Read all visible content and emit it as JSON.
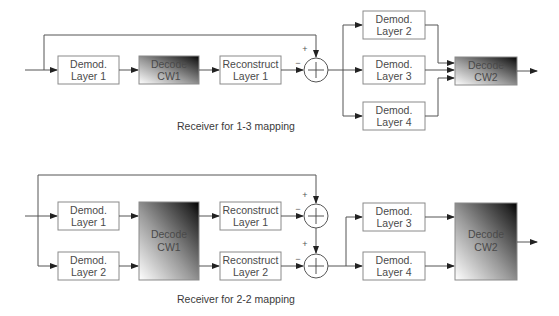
{
  "diagrams": [
    {
      "caption": "Receiver for 1-3 mapping",
      "blocks": {
        "demod1": [
          "Demod.",
          "Layer 1"
        ],
        "decode_cw1": [
          "Decode",
          "CW1"
        ],
        "reconstruct1": [
          "Reconstruct",
          "Layer 1"
        ],
        "demod2": [
          "Demod.",
          "Layer 2"
        ],
        "demod3": [
          "Demod.",
          "Layer 3"
        ],
        "demod4": [
          "Demod.",
          "Layer 4"
        ],
        "decode_cw2": [
          "Decode",
          "CW2"
        ]
      },
      "summer": {
        "plus": "+",
        "minus": "−"
      }
    },
    {
      "caption": "Receiver for 2-2 mapping",
      "blocks": {
        "demod1": [
          "Demod.",
          "Layer 1"
        ],
        "demod2": [
          "Demod.",
          "Layer 2"
        ],
        "decode_cw1": [
          "Decode",
          "CW1"
        ],
        "reconstruct1": [
          "Reconstruct",
          "Layer 1"
        ],
        "reconstruct2": [
          "Reconstruct",
          "Layer 2"
        ],
        "demod3": [
          "Demod.",
          "Layer 3"
        ],
        "demod4": [
          "Demod.",
          "Layer 4"
        ],
        "decode_cw2": [
          "Decode",
          "CW2"
        ]
      },
      "summers": [
        {
          "plus": "+",
          "minus": "−"
        },
        {
          "plus": "+",
          "minus": "−"
        }
      ]
    }
  ],
  "colors": {
    "box_border": "#8a8a8a",
    "line": "#555555",
    "text": "#4a4a4a",
    "gradient_dark": "#000000",
    "gradient_light": "#ffffff"
  }
}
